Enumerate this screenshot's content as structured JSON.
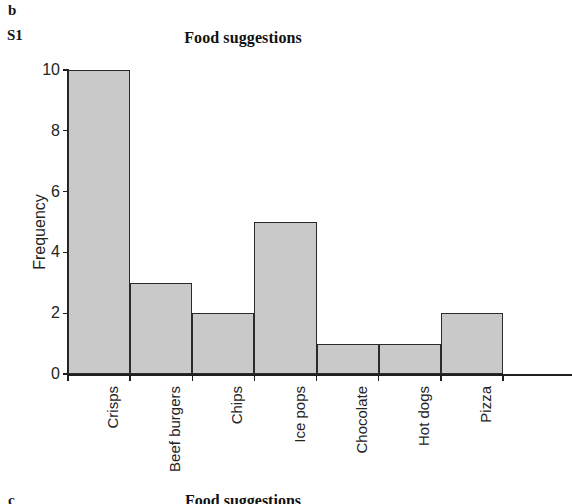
{
  "panel": {
    "letter": "b",
    "code": "S1"
  },
  "next_panel": {
    "letter": "c",
    "title": "Food suggestions"
  },
  "chart_data": {
    "type": "bar",
    "title": "Food suggestions",
    "xlabel": "",
    "ylabel": "Frequency",
    "categories": [
      "Crisps",
      "Beef burgers",
      "Chips",
      "Ice pops",
      "Chocolate",
      "Hot dogs",
      "Pizza"
    ],
    "values": [
      10,
      3,
      2,
      5,
      1,
      1,
      2
    ],
    "ylim": [
      0,
      10
    ],
    "yticks": [
      0,
      2,
      4,
      6,
      8,
      10
    ],
    "ytick_labels": [
      "0",
      "2",
      "4",
      "6",
      "8",
      "10"
    ],
    "grid": false,
    "legend": null,
    "bar_fill_color": "#c9c9c9",
    "bar_edge_color": "#2b2b2b",
    "axis_color": "#1f1f1f",
    "background_color": "#ffffff",
    "bars_contiguous": true
  }
}
